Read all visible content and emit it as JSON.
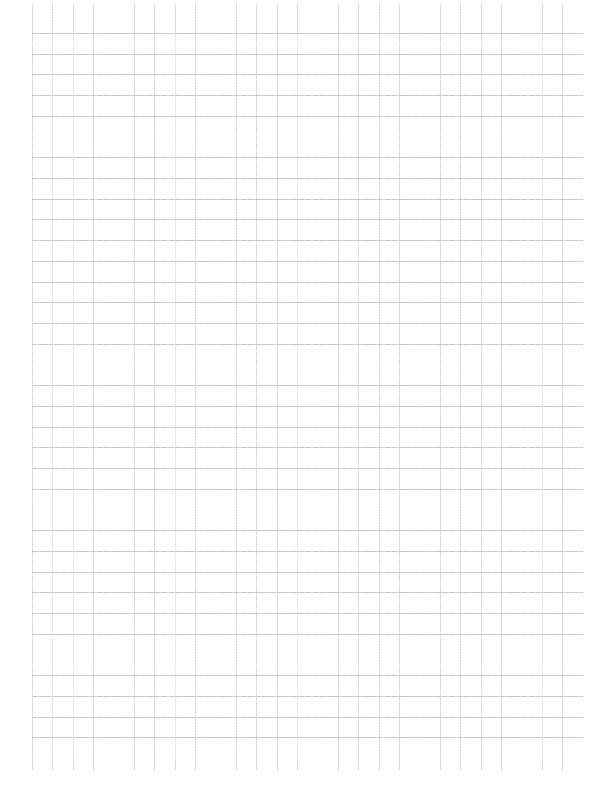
{
  "document": {
    "kind": "scanned-grid-paper",
    "title": "Blank grid paper scan",
    "page_width_px": 604,
    "page_height_px": 799,
    "background_color": "#ffffff",
    "has_text_content": false,
    "visible_text": ""
  },
  "grid": {
    "description": "Faint gray square grid ruling covering most of the sheet",
    "origin_x_px": 32,
    "origin_y_px": 33,
    "right_edge_px": 583,
    "bottom_edge_px": 757,
    "vertical_line_top_px": 4,
    "vertical_line_bottom_px": 770,
    "cell_width_px": 20.4,
    "cell_height_px": 20.72,
    "column_count": 27,
    "row_count": 35,
    "vertical_line_color": "#c9c9ce",
    "horizontal_line_color": "#bfbfc6",
    "line_weight_px": 1,
    "line_style": "faint dotted/dashed from scan"
  },
  "margins": {
    "left_px": 32,
    "top_px": 4,
    "right_px": 21,
    "bottom_px": 29,
    "color": "#ffffff"
  },
  "scan_artifacts": {
    "paper_grain": true,
    "edge_vignette": true,
    "line_breakup": true
  }
}
